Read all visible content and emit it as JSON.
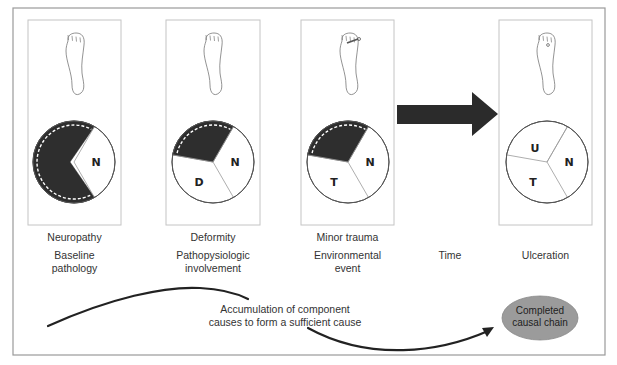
{
  "diagram": {
    "stages": [
      {
        "id": "neuropathy",
        "title": "Neuropathy",
        "subtitle": "Baseline\npathology",
        "foot": "plain",
        "segments": [
          "N"
        ],
        "shaded_remaining": true
      },
      {
        "id": "deformity",
        "title": "Deformity",
        "subtitle": "Pathopysiologic\ninvolvement",
        "foot": "clawed-toes",
        "segments": [
          "N",
          "D"
        ],
        "shaded_remaining": true
      },
      {
        "id": "minor-trauma",
        "title": "Minor trauma",
        "subtitle": "Environmental\nevent",
        "foot": "nail-injury",
        "segments": [
          "N",
          "T"
        ],
        "shaded_remaining": true
      },
      {
        "id": "ulceration",
        "title": "",
        "subtitle": "Ulceration",
        "foot": "ulcer",
        "segments": [
          "N",
          "T",
          "U"
        ],
        "shaded_remaining": false
      }
    ],
    "time_label": "Time",
    "accumulation_label": "Accumulation of component\ncauses to form a sufficient cause",
    "completed_label": "Completed\ncausal chain",
    "colors": {
      "shade": "#2e2e2e",
      "frame": "#9a9a9a",
      "ellipse_fill": "#9b9b9b",
      "arrow": "#2b2b2b"
    }
  }
}
